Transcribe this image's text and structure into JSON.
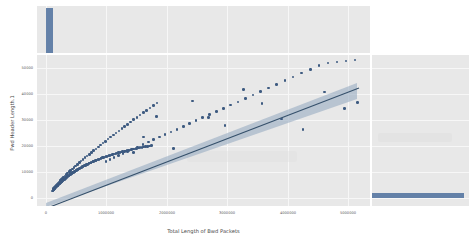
{
  "figure": {
    "kind": "jointplot-regression-scatter",
    "background_color": "#ffffff",
    "panel_color": "#e8e8e8",
    "grid_color": "#f7f7f7",
    "point_color": "#3d5a80",
    "line_color": "#35506b",
    "band_color": "#8fa6bd",
    "marginal_color": "#4c6f9c"
  },
  "chart_data": {
    "type": "scatter",
    "title": "",
    "xlabel": "Total Length of Bwd Packets",
    "ylabel": "Fwd Header Length.1",
    "xlim": [
      -250000,
      5600000
    ],
    "ylim": [
      -5000,
      54000
    ],
    "grid": true,
    "legend": null,
    "xticks": [
      0,
      1000000,
      2000000,
      3000000,
      4000000,
      5000000
    ],
    "xticklabels": [
      "0",
      "1000000",
      "2000000",
      "3000000",
      "4000000",
      "5000000"
    ],
    "yticks": [
      0,
      10000,
      20000,
      30000,
      40000,
      50000
    ],
    "yticklabels": [
      "0",
      "10000",
      "20000",
      "30000",
      "40000",
      "50000"
    ],
    "regression": {
      "shown": true,
      "slope": 0.0098,
      "intercept": -2600,
      "confidence_band": true,
      "band_widens_to_right": true
    },
    "marginal_x": {
      "type": "histogram",
      "orientation": "vertical",
      "bars": [
        {
          "center": 120000,
          "height": 1.0
        }
      ]
    },
    "marginal_y": {
      "type": "histogram",
      "orientation": "horizontal",
      "bars": [
        {
          "center": 1200,
          "height": 1.0
        }
      ]
    },
    "x": [
      20000,
      28000,
      35000,
      41000,
      47000,
      52000,
      58000,
      63000,
      69000,
      74000,
      80000,
      86000,
      92000,
      98000,
      104000,
      110000,
      116000,
      122000,
      128000,
      134000,
      140000,
      146000,
      152000,
      158000,
      164000,
      170000,
      176000,
      182000,
      188000,
      194000,
      200000,
      208000,
      215000,
      222000,
      229000,
      236000,
      243000,
      250000,
      258000,
      265000,
      272000,
      280000,
      288000,
      295000,
      303000,
      311000,
      319000,
      327000,
      335000,
      343000,
      352000,
      360000,
      369000,
      378000,
      387000,
      396000,
      405000,
      414000,
      424000,
      433000,
      443000,
      453000,
      463000,
      473000,
      484000,
      494000,
      505000,
      516000,
      527000,
      538000,
      550000,
      561000,
      573000,
      585000,
      597000,
      610000,
      622000,
      635000,
      648000,
      661000,
      675000,
      688000,
      702000,
      716000,
      731000,
      745000,
      760000,
      775000,
      790000,
      806000,
      822000,
      838000,
      854000,
      871000,
      888000,
      905000,
      923000,
      941000,
      959000,
      978000,
      997000,
      1016000,
      1036000,
      1056000,
      1077000,
      1098000,
      1119000,
      1141000,
      1163000,
      1186000,
      1209000,
      1233000,
      1257000,
      1282000,
      1307000,
      1333000,
      1359000,
      1386000,
      1414000,
      1442000,
      1471000,
      1500000,
      1530000,
      1561000,
      1592000,
      1624000,
      1657000,
      1690000,
      1724000,
      1759000,
      40000,
      55000,
      70000,
      85000,
      100000,
      118000,
      136000,
      155000,
      175000,
      196000,
      218000,
      241000,
      265000,
      290000,
      316000,
      343000,
      371000,
      400000,
      430000,
      461000,
      493000,
      526000,
      560000,
      595000,
      631000,
      668000,
      706000,
      745000,
      785000,
      826000,
      868000,
      911000,
      955000,
      1000000,
      1046000,
      1093000,
      1141000,
      1190000,
      1240000,
      1291000,
      1343000,
      1396000,
      1450000,
      1505000,
      1561000,
      1618000,
      1676000,
      1735000,
      1795000,
      1856000,
      960000,
      1030000,
      1100000,
      1180000,
      1260000,
      1345000,
      1430000,
      1520000,
      1610000,
      1705000,
      1800000,
      1900000,
      2000000,
      2105000,
      2210000,
      2320000,
      2430000,
      2545000,
      2660000,
      2780000,
      2900000,
      3025000,
      3150000,
      3280000,
      3410000,
      3545000,
      3680000,
      3820000,
      3960000,
      4105000,
      4250000,
      4400000,
      4550000,
      4705000,
      4860000,
      5020000,
      5180000,
      5340000,
      1300000,
      1450000,
      1620000,
      1850000,
      2150000,
      2480000,
      2760000,
      3050000,
      3380000,
      3700000,
      4050000,
      4420000,
      4800000,
      5150000,
      5380000
    ],
    "y": [
      900,
      1100,
      1250,
      1400,
      1550,
      1680,
      1820,
      1950,
      2080,
      2200,
      2350,
      2480,
      2600,
      2740,
      2860,
      3000,
      3120,
      3260,
      3380,
      3520,
      3640,
      3780,
      3900,
      4040,
      4160,
      4300,
      4420,
      4560,
      4680,
      4820,
      4940,
      5080,
      5200,
      5340,
      5460,
      5600,
      5720,
      5860,
      6000,
      6120,
      6260,
      6400,
      6540,
      6660,
      6800,
      6940,
      7060,
      7200,
      7340,
      7460,
      7600,
      7740,
      7880,
      8000,
      8140,
      8280,
      8420,
      8540,
      8680,
      8820,
      8960,
      9100,
      9240,
      9360,
      9500,
      9640,
      9780,
      9920,
      10060,
      10200,
      10340,
      10480,
      10620,
      10760,
      10900,
      11040,
      11180,
      11320,
      11460,
      11600,
      11740,
      11880,
      12020,
      12160,
      12300,
      12440,
      12580,
      12720,
      12860,
      13000,
      13140,
      13280,
      13420,
      13560,
      13700,
      13840,
      13980,
      14120,
      14260,
      14400,
      14540,
      14680,
      14820,
      14960,
      15100,
      15240,
      15380,
      15520,
      15660,
      15800,
      15940,
      16080,
      16220,
      16360,
      16500,
      16640,
      16780,
      16920,
      17060,
      17200,
      17340,
      17480,
      17620,
      17760,
      17900,
      18040,
      18180,
      18320,
      18460,
      18600,
      1900,
      2300,
      2700,
      3100,
      3500,
      3950,
      4400,
      4850,
      5300,
      5800,
      6300,
      6800,
      7300,
      7850,
      8400,
      8950,
      9500,
      10100,
      10700,
      11300,
      11900,
      12550,
      13200,
      13850,
      14500,
      15200,
      15900,
      16600,
      17300,
      18050,
      18800,
      19550,
      20300,
      21100,
      21900,
      22700,
      23500,
      24350,
      25200,
      26050,
      26900,
      27800,
      28700,
      29600,
      30500,
      31450,
      32400,
      33350,
      34300,
      35300,
      12500,
      13200,
      13900,
      14700,
      15500,
      16350,
      17200,
      18100,
      19000,
      19950,
      20900,
      21900,
      22900,
      23950,
      25000,
      26100,
      27200,
      28350,
      29500,
      30700,
      31900,
      33150,
      34400,
      35700,
      37000,
      38350,
      39700,
      41100,
      42500,
      43950,
      45400,
      46900,
      48400,
      49950,
      50800,
      51200,
      51600,
      52000,
      16500,
      15800,
      22000,
      30000,
      17500,
      36000,
      29500,
      26500,
      40500,
      35000,
      29000,
      25000,
      39500,
      33000,
      35500
    ]
  },
  "axis": {
    "x_title": "Total Length of Bwd Packets",
    "y_title": "Fwd Header Length.1",
    "x_tick_labels": [
      "0",
      "1000000",
      "2000000",
      "3000000",
      "4000000",
      "5000000"
    ],
    "y_tick_labels": [
      "0",
      "10000",
      "20000",
      "30000",
      "40000",
      "50000"
    ]
  }
}
